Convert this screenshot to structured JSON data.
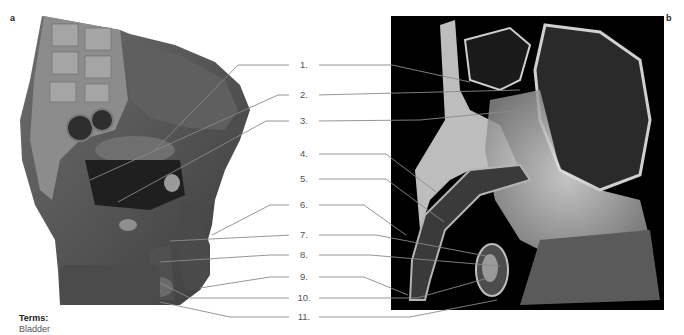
{
  "panels": {
    "a": {
      "letter": "a",
      "description": "Illustrated midsagittal section of male pelvis"
    },
    "b": {
      "letter": "b",
      "description": "Grayscale MRI-style midsagittal section of male pelvis"
    }
  },
  "labels": [
    {
      "number": "1.",
      "y": 65
    },
    {
      "number": "2.",
      "y": 95
    },
    {
      "number": "3.",
      "y": 121
    },
    {
      "number": "4.",
      "y": 154
    },
    {
      "number": "5.",
      "y": 179
    },
    {
      "number": "6.",
      "y": 205
    },
    {
      "number": "7.",
      "y": 235
    },
    {
      "number": "8.",
      "y": 255
    },
    {
      "number": "9.",
      "y": 277
    },
    {
      "number": "10.",
      "y": 298
    },
    {
      "number": "11.",
      "y": 317
    }
  ],
  "terms": {
    "title": "Terms:",
    "items": [
      "Bladder"
    ]
  },
  "colors": {
    "leader_line": "#8a8a8a",
    "label_text": "#555555",
    "panel_b_background": "#000000"
  }
}
